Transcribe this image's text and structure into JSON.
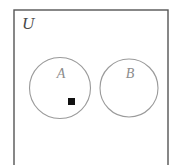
{
  "figure": {
    "type": "venn-diagram",
    "caption": "",
    "background_color": "#ffffff"
  },
  "universe": {
    "label": "U",
    "shape": "rectangle",
    "border_color": "#555555",
    "border_width": 1.4,
    "x": 14,
    "y": 10,
    "width": 154,
    "height": 158,
    "cropped_bottom": true
  },
  "sets": [
    {
      "id": "set-a",
      "label": "A",
      "shape": "circle",
      "cx": 60,
      "cy": 88,
      "r": 30.5,
      "stroke_color": "#9a9a9a",
      "stroke_width": 1.1,
      "fill": "none",
      "label_x": 61,
      "label_y": 78
    },
    {
      "id": "set-b",
      "label": "B",
      "shape": "circle",
      "cx": 129,
      "cy": 88,
      "r": 29,
      "stroke_color": "#9a9a9a",
      "stroke_width": 1.1,
      "fill": "none",
      "label_x": 130,
      "label_y": 78
    }
  ],
  "elements": [
    {
      "id": "point-marker",
      "marker": "square",
      "label": "",
      "fill_color": "#111111",
      "x": 68,
      "y": 98,
      "size": 7,
      "member_of": "A"
    }
  ],
  "universe_label_position": {
    "x": 22,
    "y": 29
  }
}
